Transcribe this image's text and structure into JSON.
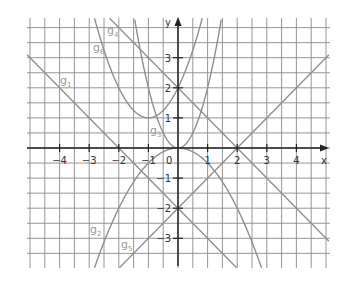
{
  "figure": {
    "axes": {
      "x_label": "x",
      "y_label": "y",
      "origin_label": "0",
      "x_ticks": [
        {
          "value": -4,
          "label": "−4"
        },
        {
          "value": -3,
          "label": "−3"
        },
        {
          "value": -2,
          "label": "−2"
        },
        {
          "value": -1,
          "label": "−1"
        },
        {
          "value": 1,
          "label": "1"
        },
        {
          "value": 2,
          "label": "2"
        },
        {
          "value": 3,
          "label": "3"
        },
        {
          "value": 4,
          "label": "4"
        }
      ],
      "y_ticks": [
        {
          "value": 3,
          "label": "3"
        },
        {
          "value": 2,
          "label": "2"
        },
        {
          "value": 1,
          "label": "1"
        },
        {
          "value": -1,
          "label": "−1"
        },
        {
          "value": -2,
          "label": "−2"
        },
        {
          "value": -3,
          "label": "−3"
        }
      ],
      "xlim": [
        -5,
        5
      ],
      "ylim": [
        -4,
        4.3
      ],
      "grid_step": 0.5
    },
    "functions": [
      {
        "id": "g1",
        "name": "g",
        "sub": "1",
        "expr": "-x-2",
        "label_pos": [
          60,
          84
        ]
      },
      {
        "id": "g2",
        "name": "g",
        "sub": "2",
        "expr": "-0.5*x^2",
        "label_pos": [
          90,
          233
        ]
      },
      {
        "id": "g3",
        "name": "g",
        "sub": "3",
        "expr": "2*x^2",
        "label_pos": [
          150,
          134
        ]
      },
      {
        "id": "g4",
        "name": "g",
        "sub": "4",
        "expr": "-x+2",
        "label_pos": [
          107,
          34
        ]
      },
      {
        "id": "g5",
        "name": "g",
        "sub": "5",
        "expr": "x-2",
        "label_pos": [
          121,
          248
        ]
      },
      {
        "id": "g6",
        "name": "g",
        "sub": "6",
        "expr": "(x+1)^2+1",
        "label_pos": [
          93,
          51
        ]
      }
    ],
    "colors": {
      "grid": "#8a8a8a",
      "axis": "#222222",
      "curve": "#8f8f8f",
      "label": "#9a9a9a"
    }
  }
}
